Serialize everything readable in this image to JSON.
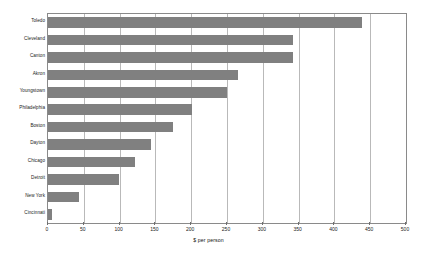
{
  "chart_data": {
    "type": "bar",
    "orientation": "horizontal",
    "title": "",
    "xlabel": "$ per person",
    "ylabel": "",
    "xlim": [
      0,
      500
    ],
    "ylim": null,
    "grid": true,
    "legend": false,
    "bar_color": "#808080",
    "frame_color": "#8a8a8a",
    "gridline_color": "#b9b9b9",
    "xticks": [
      0,
      50,
      100,
      150,
      200,
      250,
      300,
      350,
      400,
      450,
      500
    ],
    "xtick_labels": [
      "0",
      "50",
      "100",
      "150",
      "200",
      "250",
      "300",
      "350",
      "400",
      "450",
      "500"
    ],
    "categories": [
      "Toledo",
      "Cleveland",
      "Canton",
      "Akron",
      "Youngstown",
      "Philadelphia",
      "Boston",
      "Dayton",
      "Chicago",
      "Detroit",
      "New York",
      "Cincinnati"
    ],
    "values": [
      439,
      342,
      342,
      266,
      250,
      201,
      175,
      144,
      122,
      99,
      43,
      5
    ]
  }
}
